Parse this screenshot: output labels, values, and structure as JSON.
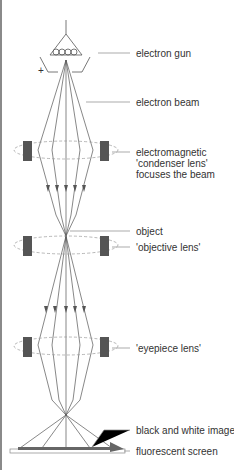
{
  "diagram": {
    "colors": {
      "line": "#555555",
      "lens": "#555555",
      "dashed": "#999999",
      "screen": "#666666"
    },
    "labels": {
      "electron_gun": "electron gun",
      "electron_beam": "electron beam",
      "condenser_line1": "electromagnetic",
      "condenser_line2": "'condenser lens'",
      "condenser_line3": "focuses the beam",
      "object": "object",
      "objective_lens": "'objective lens'",
      "eyepiece_lens": "'eyepiece lens'",
      "image": "black and white image",
      "screen": "fluorescent screen"
    },
    "symbols": {
      "plus": "+"
    }
  }
}
